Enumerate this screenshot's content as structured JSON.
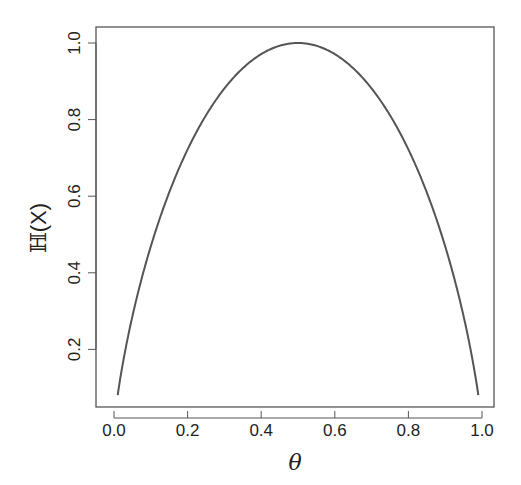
{
  "chart_data": {
    "type": "line",
    "title": "",
    "xlabel": "θ",
    "ylabel": "ℍ(X)",
    "xlim": [
      -0.05,
      1.04
    ],
    "ylim": [
      0.05,
      1.04
    ],
    "x_ticks": [
      0.0,
      0.2,
      0.4,
      0.6,
      0.8,
      1.0
    ],
    "x_tick_labels": [
      "0.0",
      "0.2",
      "0.4",
      "0.6",
      "0.8",
      "1.0"
    ],
    "y_ticks": [
      0.2,
      0.4,
      0.6,
      0.8,
      1.0
    ],
    "y_tick_labels": [
      "0.2",
      "0.4",
      "0.6",
      "0.8",
      "1.0"
    ],
    "grid": false,
    "legend": null,
    "series": [
      {
        "name": "Binary entropy H(θ) = -θ log2 θ - (1-θ) log2(1-θ)",
        "x": [
          0.01,
          0.05,
          0.1,
          0.15,
          0.2,
          0.25,
          0.3,
          0.35,
          0.4,
          0.45,
          0.5,
          0.55,
          0.6,
          0.65,
          0.7,
          0.75,
          0.8,
          0.85,
          0.9,
          0.95,
          0.99
        ],
        "values": [
          0.081,
          0.286,
          0.469,
          0.61,
          0.722,
          0.811,
          0.881,
          0.934,
          0.971,
          0.993,
          1.0,
          0.993,
          0.971,
          0.934,
          0.881,
          0.811,
          0.722,
          0.61,
          0.469,
          0.286,
          0.081
        ],
        "color": "#555555"
      }
    ]
  },
  "labels": {
    "x_axis_title": "θ",
    "y_axis_title_bb": "ℍ",
    "y_axis_title_rest": "(X)"
  },
  "ticks": {
    "x": [
      "0.0",
      "0.2",
      "0.4",
      "0.6",
      "0.8",
      "1.0"
    ],
    "y": [
      "0.2",
      "0.4",
      "0.6",
      "0.8",
      "1.0"
    ]
  }
}
